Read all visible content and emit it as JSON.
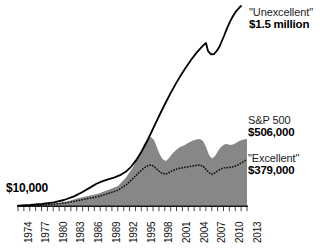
{
  "chart_data": {
    "type": "area",
    "title": "",
    "subtitle": "",
    "xlabel": "",
    "ylabel": "",
    "grid": false,
    "legend_position": "inline-right-annotations",
    "x_axis": {
      "start_year": 1974,
      "end_year": 2013,
      "tick_interval_years": 1,
      "label_interval_years": 3,
      "tick_labels": [
        "1974",
        "1977",
        "1980",
        "1983",
        "1986",
        "1989",
        "1992",
        "1995",
        "1998",
        "2001",
        "2004",
        "2007",
        "2010",
        "2013"
      ],
      "label_rotation_deg": -90
    },
    "y_axis": {
      "scale": "linear-growth-of-$10,000",
      "start_value_label": "$10,000",
      "ylim": [
        0,
        1500000
      ],
      "ticks_visible": false
    },
    "series": [
      {
        "name": "\"Unexcellent\"",
        "end_value_label": "$1.5 million",
        "end_value": 1500000,
        "style": "solid-line",
        "color": "#000000",
        "x": [
          1974,
          1976,
          1978,
          1980,
          1982,
          1984,
          1986,
          1988,
          1990,
          1992,
          1994,
          1996,
          1998,
          1999,
          2000,
          2001,
          2002,
          2003,
          2004,
          2005,
          2006,
          2007,
          2008,
          2009,
          2010,
          2011,
          2012,
          2013
        ],
        "values": [
          10000,
          12000,
          15000,
          20000,
          28000,
          42000,
          62000,
          88000,
          105000,
          130000,
          165000,
          210000,
          300000,
          370000,
          450000,
          530000,
          620000,
          700000,
          790000,
          880000,
          960000,
          1040000,
          1010000,
          980000,
          1010000,
          1080000,
          1250000,
          1500000
        ]
      },
      {
        "name": "S&P 500",
        "end_value_label": "$506,000",
        "end_value": 506000,
        "style": "filled-area",
        "color": "#878787",
        "x": [
          1974,
          1976,
          1978,
          1980,
          1982,
          1984,
          1986,
          1988,
          1990,
          1992,
          1994,
          1996,
          1998,
          1999,
          2000,
          2001,
          2002,
          2003,
          2004,
          2005,
          2006,
          2007,
          2008,
          2009,
          2010,
          2011,
          2012,
          2013
        ],
        "values": [
          10000,
          11500,
          13000,
          17000,
          21000,
          28000,
          40000,
          47000,
          55000,
          70000,
          85000,
          125000,
          230000,
          330000,
          430000,
          400000,
          310000,
          350000,
          400000,
          430000,
          480000,
          510000,
          330000,
          390000,
          460000,
          455000,
          480000,
          506000
        ]
      },
      {
        "name": "\"Excellent\"",
        "end_value_label": "$379,000",
        "end_value": 379000,
        "style": "dotted-line",
        "color": "#111111",
        "x": [
          1974,
          1976,
          1978,
          1980,
          1982,
          1984,
          1986,
          1988,
          1990,
          1992,
          1994,
          1996,
          1998,
          1999,
          2000,
          2001,
          2002,
          2003,
          2004,
          2005,
          2006,
          2007,
          2008,
          2009,
          2010,
          2011,
          2012,
          2013
        ],
        "values": [
          10000,
          11000,
          12500,
          15500,
          19000,
          25000,
          34000,
          41000,
          48000,
          60000,
          73000,
          100000,
          160000,
          215000,
          255000,
          250000,
          215000,
          230000,
          255000,
          265000,
          285000,
          300000,
          230000,
          265000,
          300000,
          305000,
          330000,
          379000
        ]
      }
    ],
    "annotations": [
      {
        "id": "unexcellent",
        "name": "\"Unexcellent\"",
        "value": "$1.5 million"
      },
      {
        "id": "sp500",
        "name": "S&P 500",
        "value": "$506,000"
      },
      {
        "id": "excellent",
        "name": "\"Excellent\"",
        "value": "$379,000"
      },
      {
        "id": "start",
        "name": "",
        "value": "$10,000"
      }
    ]
  },
  "annotations": {
    "unexcellent": {
      "name": "\"Unexcellent\"",
      "value": "$1.5 million"
    },
    "sp500": {
      "name": "S&P 500",
      "value": "$506,000"
    },
    "excellent": {
      "name": "\"Excellent\"",
      "value": "$379,000"
    },
    "start": {
      "value": "$10,000"
    }
  },
  "x_ticks": [
    {
      "label": "1974"
    },
    {
      "label": "1977"
    },
    {
      "label": "1980"
    },
    {
      "label": "1983"
    },
    {
      "label": "1986"
    },
    {
      "label": "1989"
    },
    {
      "label": "1992"
    },
    {
      "label": "1995"
    },
    {
      "label": "1998"
    },
    {
      "label": "2001"
    },
    {
      "label": "2004"
    },
    {
      "label": "2007"
    },
    {
      "label": "2010"
    },
    {
      "label": "2013"
    }
  ],
  "colors": {
    "area_fill": "#878787",
    "line": "#000000",
    "axis": "#1a1a1a",
    "text": "#111111",
    "background": "#ffffff"
  }
}
